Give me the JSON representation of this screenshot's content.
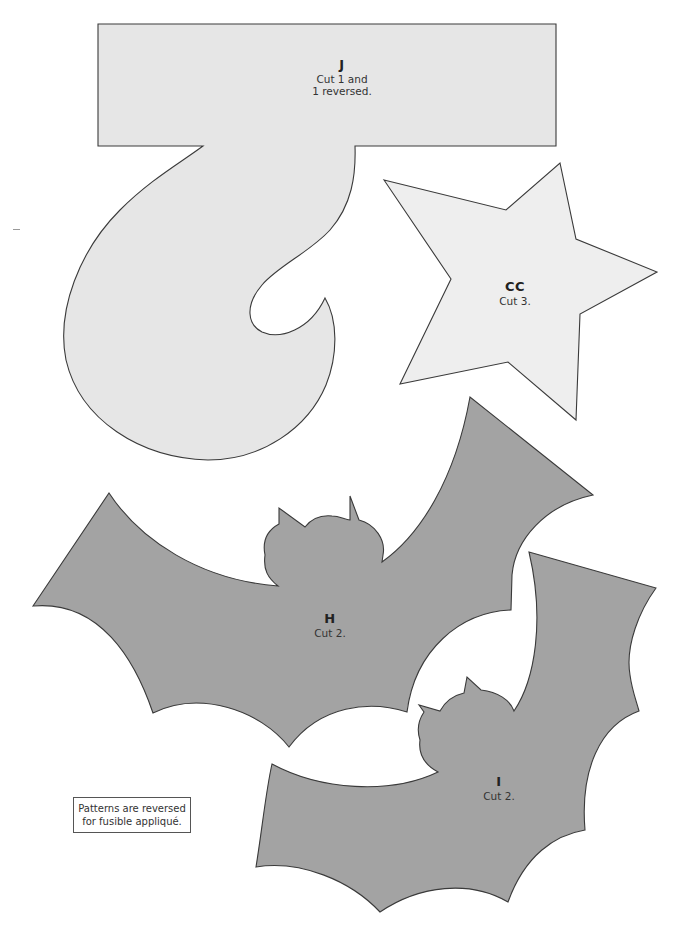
{
  "page": {
    "type": "applique-pattern-sheet",
    "background_color": "#ffffff"
  },
  "pieces": [
    {
      "id": "J",
      "code": "J",
      "instruction_lines": [
        "Cut 1 and",
        "1 reversed."
      ],
      "fill": "#e6e6e6",
      "shape": "hook-letter-j"
    },
    {
      "id": "CC",
      "code": "CC",
      "instruction_lines": [
        "Cut 3."
      ],
      "fill": "#eeeeee",
      "shape": "star"
    },
    {
      "id": "H",
      "code": "H",
      "instruction_lines": [
        "Cut 2."
      ],
      "fill": "#a3a3a3",
      "shape": "bat-large"
    },
    {
      "id": "I",
      "code": "I",
      "instruction_lines": [
        "Cut 2."
      ],
      "fill": "#a3a3a3",
      "shape": "bat-small"
    }
  ],
  "note": {
    "lines": [
      "Patterns are reversed",
      "for fusible appliqué."
    ]
  },
  "colors": {
    "outline": "#3a3a3a",
    "light_piece": "#e6e6e6",
    "star_piece": "#eeeeee",
    "bat_piece": "#a3a3a3"
  }
}
